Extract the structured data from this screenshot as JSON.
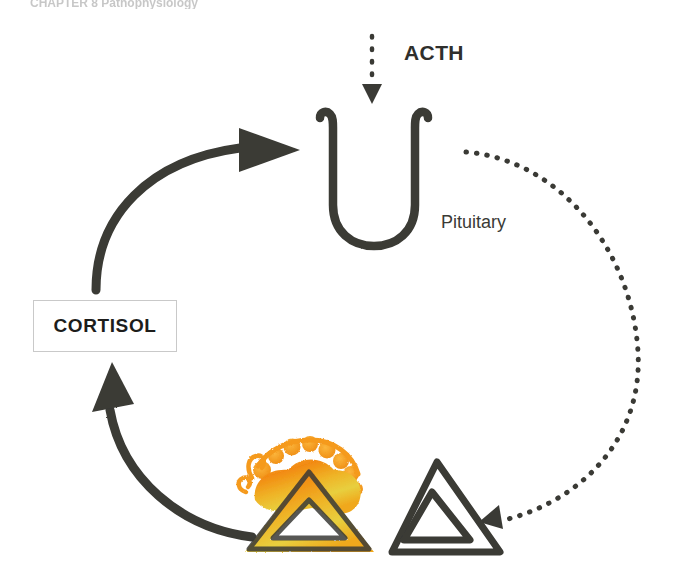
{
  "figure": {
    "domain_type": "diagram",
    "background_color": "#ffffff",
    "stroke_color": "#3a3a35",
    "adrenal_color_bright": "#f59a1e",
    "adrenal_color_gold": "#e8c23a",
    "adrenal_color_deep": "#e2730f",
    "caption_fragment": "CHAPTER  8    Pathophysiology"
  },
  "labels": {
    "acth": "ACTH",
    "pituitary": "Pituitary",
    "cortisol": "CORTISOL"
  },
  "elements": {
    "acth_arrow": "dotted-down-arrow-icon",
    "pituitary_shape": "pituitary-u-shape-icon",
    "feedback_curve": "dotted-feedback-arrow-icon",
    "cortisol_to_pituitary_arrow": "thick-curved-arrow-up-icon",
    "adrenal_to_cortisol_arrow": "thick-curved-arrow-left-icon",
    "adrenal_gland_active": "orange-adrenal-triangle-icon",
    "adrenal_gland_outline": "outline-adrenal-triangle-icon"
  }
}
